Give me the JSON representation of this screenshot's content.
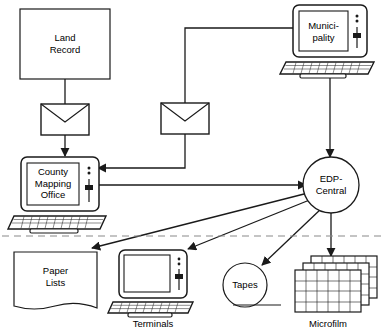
{
  "diagram": {
    "background_color": "#ffffff",
    "line_color": "#1a1a1a",
    "dashed_divider_color": "#888888",
    "nodes": {
      "land_record": {
        "label": "Land\nRecord",
        "shape": "rectangle",
        "icon": "document-box"
      },
      "municipality": {
        "label": "Munici-\npality",
        "shape": "computer",
        "icon": "computer-icon"
      },
      "county_mapping_office": {
        "label": "County\nMapping\nOffice",
        "shape": "computer",
        "icon": "computer-icon"
      },
      "edp_central": {
        "label": "EDP-\nCentral",
        "shape": "circle",
        "icon": "circle-node"
      },
      "paper_lists": {
        "label": "Paper\nLists",
        "shape": "document",
        "icon": "document-icon"
      },
      "terminals": {
        "label": "Terminals",
        "shape": "computer",
        "icon": "computer-icon"
      },
      "tapes": {
        "label": "Tapes",
        "shape": "circle-with-base",
        "icon": "tape-reel-icon"
      },
      "microfilm": {
        "label": "Microfilm",
        "shape": "card-stack",
        "icon": "microfilm-cards-icon"
      },
      "envelope_left": {
        "label": "",
        "shape": "envelope",
        "icon": "envelope-icon"
      },
      "envelope_right": {
        "label": "",
        "shape": "envelope",
        "icon": "envelope-icon"
      }
    },
    "connections": [
      {
        "from": "land_record",
        "to": "envelope_left",
        "arrow": false
      },
      {
        "from": "envelope_left",
        "to": "county_mapping_office",
        "arrow": true
      },
      {
        "from": "municipality",
        "to": "envelope_right",
        "arrow": false
      },
      {
        "from": "envelope_right",
        "to": "county_mapping_office",
        "arrow": true
      },
      {
        "from": "municipality",
        "to": "edp_central",
        "arrow": true
      },
      {
        "from": "county_mapping_office",
        "to": "edp_central",
        "arrow": true
      },
      {
        "from": "edp_central",
        "to": "paper_lists",
        "arrow": true
      },
      {
        "from": "edp_central",
        "to": "terminals",
        "arrow": true
      },
      {
        "from": "edp_central",
        "to": "tapes",
        "arrow": true
      },
      {
        "from": "edp_central",
        "to": "microfilm",
        "arrow": true
      }
    ]
  }
}
